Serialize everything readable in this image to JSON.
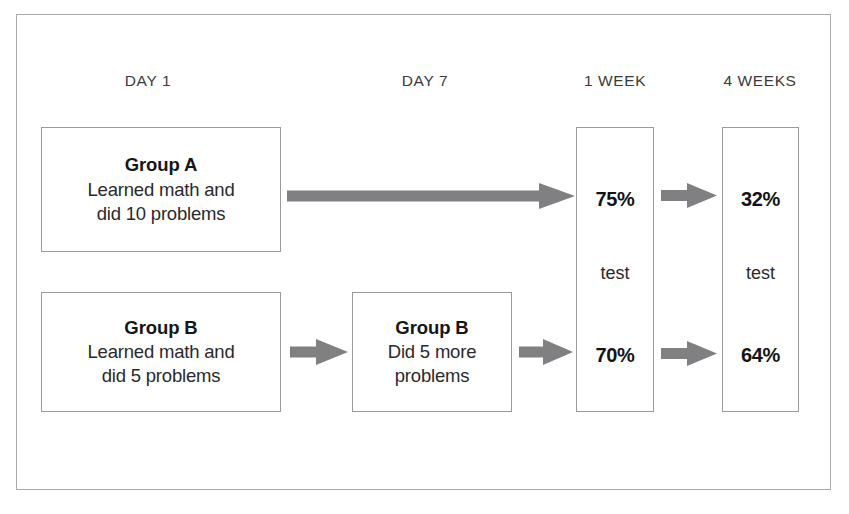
{
  "diagram": {
    "frame": {
      "border_color": "#a9a9ad"
    },
    "arrow_color": "#808083",
    "box_border_color": "#9a9a9e",
    "headers": [
      {
        "id": "day1",
        "label": "DAY 1"
      },
      {
        "id": "day7",
        "label": "DAY 7"
      },
      {
        "id": "week1",
        "label": "1 WEEK"
      },
      {
        "id": "week4",
        "label": "4 WEEKS"
      }
    ],
    "nodes": [
      {
        "id": "group-a-day1",
        "title": "Group A",
        "lines": [
          "Learned math and",
          "did 10 problems"
        ]
      },
      {
        "id": "group-b-day1",
        "title": "Group B",
        "lines": [
          "Learned math and",
          "did 5 problems"
        ]
      },
      {
        "id": "group-b-day7",
        "title": "Group B",
        "lines": [
          "Did 5 more",
          "problems"
        ]
      }
    ],
    "test_columns": [
      {
        "id": "test-1-week",
        "header": "1 WEEK",
        "label": "test",
        "top_value": "75%",
        "bottom_value": "70%"
      },
      {
        "id": "test-4-weeks",
        "header": "4 WEEKS",
        "label": "test",
        "top_value": "32%",
        "bottom_value": "64%"
      }
    ],
    "arrows": [
      {
        "id": "arrow-group-a-to-1week",
        "name": "arrow-long-group-a"
      },
      {
        "id": "arrow-group-b-day1-to-day7",
        "name": "arrow-group-b-day1-to-day7"
      },
      {
        "id": "arrow-group-b-day7-to-1week",
        "name": "arrow-group-b-day7-to-1week"
      },
      {
        "id": "arrow-75-to-32",
        "name": "arrow-1week-to-4weeks-top"
      },
      {
        "id": "arrow-70-to-64",
        "name": "arrow-1week-to-4weeks-bottom"
      }
    ]
  }
}
